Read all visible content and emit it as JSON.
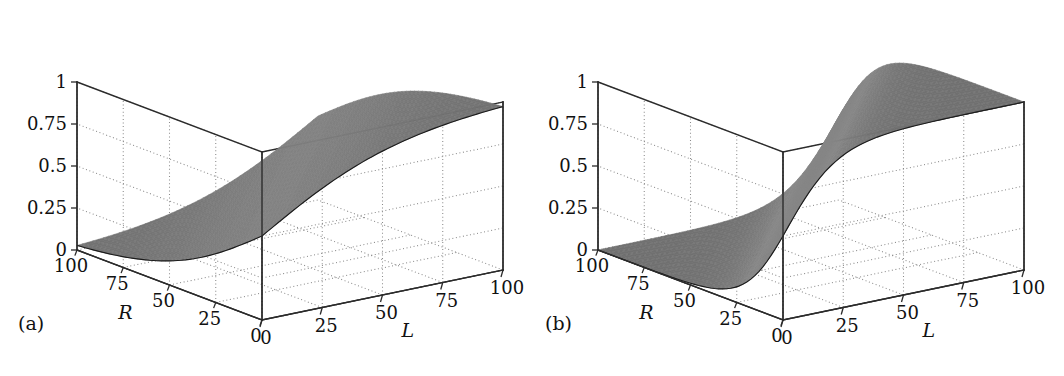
{
  "figure": {
    "background": "#ffffff",
    "surface_color": "#6e6e6e",
    "surface_color_light": "#8c8c8c",
    "line_color": "#2b2b2b",
    "grid_color": "#8a8a8a"
  },
  "panels": [
    {
      "id": "a",
      "label": "(a)",
      "label_x": 18,
      "label_y": 322,
      "origin_x": 0
    },
    {
      "id": "b",
      "label": "(b)",
      "label_x": 545,
      "label_y": 322,
      "origin_x": 521
    }
  ],
  "axes": {
    "x_label": "L",
    "y_label": "R",
    "x_ticks": [
      "0",
      "25",
      "50",
      "75",
      "100"
    ],
    "y_ticks": [
      "100",
      "75",
      "50",
      "25",
      "0"
    ],
    "z_ticks": [
      "1",
      "0.75",
      "0.5",
      "0.25",
      "0"
    ],
    "x_range": [
      0,
      100
    ],
    "y_range": [
      0,
      100
    ],
    "z_range": [
      0,
      1
    ]
  },
  "chart_data": [
    {
      "type": "surface",
      "panel": "a",
      "title": "",
      "xlabel": "L",
      "ylabel": "R",
      "zlabel": "",
      "xlim": [
        0,
        100
      ],
      "ylim": [
        0,
        100
      ],
      "zlim": [
        0,
        1
      ],
      "xticks": [
        0,
        25,
        50,
        75,
        100
      ],
      "yticks": [
        0,
        25,
        50,
        75,
        100
      ],
      "zticks": [
        0,
        0.25,
        0.5,
        0.75,
        1
      ],
      "grid": true,
      "legend": "none",
      "description": "Smooth sigmoidal surface rising from z=0 at (L=0,R=100) to z~0.9 at (L=100,R=0); saddle-like gradual logistic in (L-R).",
      "model": "logistic",
      "formula": "z = 1 / (1 + exp(-(L - R)/28))",
      "steepness": 28,
      "z_at_corners": {
        "L0_R0": 0.5,
        "L0_R100": 0.03,
        "L100_R0": 0.97,
        "L100_R100": 0.5
      },
      "samples": {
        "L": [
          0,
          25,
          50,
          75,
          100
        ],
        "R": [
          0,
          25,
          50,
          75,
          100
        ],
        "z": [
          [
            0.5,
            0.29,
            0.14,
            0.06,
            0.03
          ],
          [
            0.71,
            0.5,
            0.29,
            0.14,
            0.06
          ],
          [
            0.86,
            0.71,
            0.5,
            0.29,
            0.14
          ],
          [
            0.94,
            0.86,
            0.71,
            0.5,
            0.29
          ],
          [
            0.97,
            0.94,
            0.86,
            0.71,
            0.5
          ]
        ]
      }
    },
    {
      "type": "surface",
      "panel": "b",
      "title": "",
      "xlabel": "L",
      "ylabel": "R",
      "zlabel": "",
      "xlim": [
        0,
        100
      ],
      "ylim": [
        0,
        100
      ],
      "zlim": [
        0,
        1
      ],
      "xticks": [
        0,
        25,
        50,
        75,
        100
      ],
      "yticks": [
        0,
        25,
        50,
        75,
        100
      ],
      "zticks": [
        0,
        0.25,
        0.5,
        0.75,
        1
      ],
      "grid": true,
      "legend": "none",
      "description": "Steeper sigmoidal surface with sharper transition; flat low plateau near z=0 over large R and low L, abrupt rise to z~0.9 plateau.",
      "model": "logistic",
      "formula": "z = 1 / (1 + exp(-(L - R)/11))",
      "steepness": 11,
      "z_at_corners": {
        "L0_R0": 0.5,
        "L0_R100": 0.0001,
        "L100_R0": 0.9999,
        "L100_R100": 0.5
      },
      "samples": {
        "L": [
          0,
          25,
          50,
          75,
          100
        ],
        "R": [
          0,
          25,
          50,
          75,
          100
        ],
        "z": [
          [
            0.5,
            0.1,
            0.01,
            0.0,
            0.0
          ],
          [
            0.9,
            0.5,
            0.1,
            0.01,
            0.0
          ],
          [
            0.99,
            0.9,
            0.5,
            0.1,
            0.01
          ],
          [
            1.0,
            0.99,
            0.9,
            0.5,
            0.1
          ],
          [
            1.0,
            1.0,
            0.99,
            0.9,
            0.5
          ]
        ]
      }
    }
  ]
}
